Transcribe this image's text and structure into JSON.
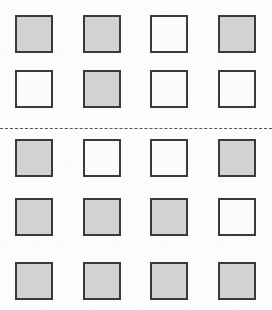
{
  "figure": {
    "width": 272,
    "height": 310,
    "background_color": "#fcfcfb",
    "columns": 4,
    "rows": 5,
    "square_size": 38,
    "square_fill_color": "#d2d2d2",
    "square_empty_color": "#fbfbfa",
    "square_border_color": "#3a3a3a",
    "square_border_width": 2,
    "column_x": [
      15,
      83,
      150,
      218
    ],
    "row_y": [
      15,
      70,
      139,
      198,
      262
    ]
  },
  "separator": {
    "name": "dashed-divider",
    "y": 128,
    "style": "dashed",
    "color": "#555555",
    "thickness": 1,
    "after_row_index": 1
  },
  "grid": {
    "cells": [
      {
        "row": 0,
        "col": 0,
        "x": 15,
        "y": 15,
        "state": "filled"
      },
      {
        "row": 0,
        "col": 1,
        "x": 83,
        "y": 15,
        "state": "filled"
      },
      {
        "row": 0,
        "col": 2,
        "x": 150,
        "y": 15,
        "state": "empty"
      },
      {
        "row": 0,
        "col": 3,
        "x": 218,
        "y": 15,
        "state": "filled"
      },
      {
        "row": 1,
        "col": 0,
        "x": 15,
        "y": 70,
        "state": "empty"
      },
      {
        "row": 1,
        "col": 1,
        "x": 83,
        "y": 70,
        "state": "filled"
      },
      {
        "row": 1,
        "col": 2,
        "x": 150,
        "y": 70,
        "state": "empty"
      },
      {
        "row": 1,
        "col": 3,
        "x": 218,
        "y": 70,
        "state": "empty"
      },
      {
        "row": 2,
        "col": 0,
        "x": 15,
        "y": 139,
        "state": "filled"
      },
      {
        "row": 2,
        "col": 1,
        "x": 83,
        "y": 139,
        "state": "empty"
      },
      {
        "row": 2,
        "col": 2,
        "x": 150,
        "y": 139,
        "state": "empty"
      },
      {
        "row": 2,
        "col": 3,
        "x": 218,
        "y": 139,
        "state": "filled"
      },
      {
        "row": 3,
        "col": 0,
        "x": 15,
        "y": 198,
        "state": "filled"
      },
      {
        "row": 3,
        "col": 1,
        "x": 83,
        "y": 198,
        "state": "filled"
      },
      {
        "row": 3,
        "col": 2,
        "x": 150,
        "y": 198,
        "state": "filled"
      },
      {
        "row": 3,
        "col": 3,
        "x": 218,
        "y": 198,
        "state": "empty"
      },
      {
        "row": 4,
        "col": 0,
        "x": 15,
        "y": 262,
        "state": "filled"
      },
      {
        "row": 4,
        "col": 1,
        "x": 83,
        "y": 262,
        "state": "filled"
      },
      {
        "row": 4,
        "col": 2,
        "x": 150,
        "y": 262,
        "state": "filled"
      },
      {
        "row": 4,
        "col": 3,
        "x": 218,
        "y": 262,
        "state": "filled"
      }
    ]
  }
}
